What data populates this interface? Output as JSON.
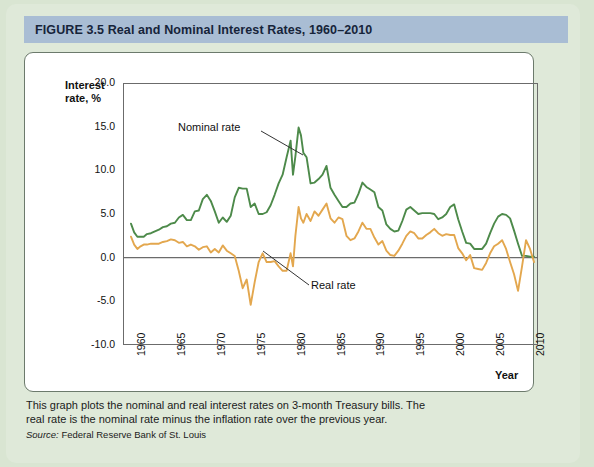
{
  "figure": {
    "label": "FIGURE",
    "number": "3.5",
    "title": "Real and Nominal Interest Rates, 1960–2010"
  },
  "colors": {
    "title_bar": "#a9bdd4",
    "page_background": "#dfe9d9",
    "nominal_line": "#4d8a4a",
    "real_line": "#e3a74e",
    "axis": "#6b6b6b"
  },
  "axis_title": "Interest rate, %",
  "x_axis_title": "Year",
  "annotations": [
    {
      "name": "nominal-rate-label",
      "text": "Nominal rate"
    },
    {
      "name": "real-rate-label",
      "text": "Real rate"
    }
  ],
  "caption": "This graph plots the nominal and real interest rates on 3-month Treasury bills. The real rate is the nominal rate minus the inflation rate over the previous year.",
  "source": {
    "word": "Source:",
    "text": " Federal Reserve Bank of St. Louis"
  },
  "chart_data": {
    "type": "line",
    "title": "Real and Nominal Interest Rates, 1960–2010",
    "xlabel": "Year",
    "ylabel": "Interest rate, %",
    "xlim": [
      1959.0,
      2011.0
    ],
    "ylim": [
      -10.0,
      20.0
    ],
    "yticks": [
      -10.0,
      -5.0,
      0.0,
      5.0,
      10.0,
      15.0,
      20.0
    ],
    "ytick_labels": [
      "-10.0",
      "-5.0",
      "0.0",
      "5.0",
      "10.0",
      "15.0",
      "20.0"
    ],
    "xticks": [
      1960,
      1965,
      1970,
      1975,
      1980,
      1985,
      1990,
      1995,
      2000,
      2005,
      2010
    ],
    "xtick_labels": [
      "1960",
      "1965",
      "1970",
      "1975",
      "1980",
      "1985",
      "1990",
      "1995",
      "2000",
      "2005",
      "2010"
    ],
    "grid": false,
    "legend": "annotated-inline",
    "zero_line": true,
    "series": [
      {
        "name": "Nominal rate",
        "color": "#4d8a4a",
        "x": [
          1960.0,
          1960.4,
          1960.8,
          1961.2,
          1961.6,
          1962.0,
          1962.5,
          1963.0,
          1963.5,
          1964.0,
          1964.5,
          1965.0,
          1965.5,
          1966.0,
          1966.5,
          1967.0,
          1967.5,
          1968.0,
          1968.5,
          1969.0,
          1969.5,
          1970.0,
          1970.5,
          1971.0,
          1971.5,
          1972.0,
          1972.5,
          1973.0,
          1973.5,
          1974.0,
          1974.5,
          1975.0,
          1975.5,
          1976.0,
          1976.5,
          1977.0,
          1977.5,
          1978.0,
          1978.5,
          1979.0,
          1979.5,
          1980.0,
          1980.3,
          1980.6,
          1981.0,
          1981.3,
          1981.6,
          1982.0,
          1982.5,
          1983.0,
          1983.5,
          1984.0,
          1984.5,
          1985.0,
          1985.5,
          1986.0,
          1986.5,
          1987.0,
          1987.5,
          1988.0,
          1988.5,
          1989.0,
          1989.5,
          1990.0,
          1990.5,
          1991.0,
          1991.5,
          1992.0,
          1992.5,
          1993.0,
          1993.5,
          1994.0,
          1994.5,
          1995.0,
          1995.5,
          1996.0,
          1996.5,
          1997.0,
          1997.5,
          1998.0,
          1998.5,
          1999.0,
          1999.5,
          2000.0,
          2000.5,
          2001.0,
          2001.5,
          2002.0,
          2002.5,
          2003.0,
          2003.5,
          2004.0,
          2004.5,
          2005.0,
          2005.5,
          2006.0,
          2006.5,
          2007.0,
          2007.5,
          2008.0,
          2008.5,
          2009.0,
          2009.5,
          2010.0,
          2010.5
        ],
        "y": [
          3.9,
          2.9,
          2.4,
          2.4,
          2.4,
          2.7,
          2.8,
          3.0,
          3.2,
          3.5,
          3.6,
          3.9,
          4.0,
          4.6,
          4.9,
          4.3,
          4.3,
          5.3,
          5.4,
          6.7,
          7.2,
          6.5,
          5.3,
          4.0,
          4.6,
          4.1,
          4.8,
          6.9,
          8.0,
          7.9,
          7.9,
          5.8,
          6.2,
          5.0,
          5.0,
          5.2,
          6.0,
          7.2,
          8.5,
          9.5,
          11.5,
          13.4,
          9.5,
          11.6,
          14.9,
          14.0,
          12.0,
          11.5,
          8.5,
          8.6,
          9.0,
          9.5,
          10.5,
          8.0,
          7.2,
          6.5,
          5.8,
          5.8,
          6.2,
          6.3,
          7.3,
          8.6,
          8.1,
          7.8,
          7.5,
          5.8,
          5.4,
          3.8,
          3.3,
          3.0,
          3.1,
          4.2,
          5.5,
          5.8,
          5.4,
          5.0,
          5.1,
          5.1,
          5.1,
          5.0,
          4.4,
          4.6,
          5.0,
          5.8,
          6.1,
          4.4,
          3.0,
          1.7,
          1.6,
          1.0,
          1.0,
          1.0,
          1.6,
          2.8,
          3.9,
          4.7,
          5.0,
          4.9,
          4.5,
          3.1,
          1.6,
          0.2,
          0.2,
          0.1,
          0.1
        ]
      },
      {
        "name": "Real rate",
        "color": "#e3a74e",
        "x": [
          1960.0,
          1960.4,
          1960.8,
          1961.2,
          1961.6,
          1962.0,
          1962.5,
          1963.0,
          1963.5,
          1964.0,
          1964.5,
          1965.0,
          1965.5,
          1966.0,
          1966.5,
          1967.0,
          1967.5,
          1968.0,
          1968.5,
          1969.0,
          1969.5,
          1970.0,
          1970.5,
          1971.0,
          1971.5,
          1972.0,
          1972.5,
          1973.0,
          1973.5,
          1974.0,
          1974.5,
          1975.0,
          1975.5,
          1976.0,
          1976.5,
          1977.0,
          1977.5,
          1978.0,
          1978.5,
          1979.0,
          1979.5,
          1980.0,
          1980.3,
          1980.6,
          1981.0,
          1981.3,
          1981.6,
          1982.0,
          1982.5,
          1983.0,
          1983.5,
          1984.0,
          1984.5,
          1985.0,
          1985.5,
          1986.0,
          1986.5,
          1987.0,
          1987.5,
          1988.0,
          1988.5,
          1989.0,
          1989.5,
          1990.0,
          1990.5,
          1991.0,
          1991.5,
          1992.0,
          1992.5,
          1993.0,
          1993.5,
          1994.0,
          1994.5,
          1995.0,
          1995.5,
          1996.0,
          1996.5,
          1997.0,
          1997.5,
          1998.0,
          1998.5,
          1999.0,
          1999.5,
          2000.0,
          2000.5,
          2001.0,
          2001.5,
          2002.0,
          2002.5,
          2003.0,
          2003.5,
          2004.0,
          2004.5,
          2005.0,
          2005.5,
          2006.0,
          2006.5,
          2007.0,
          2007.5,
          2008.0,
          2008.5,
          2009.0,
          2009.5,
          2010.0,
          2010.5
        ],
        "y": [
          2.4,
          1.5,
          1.0,
          1.3,
          1.5,
          1.5,
          1.6,
          1.6,
          1.6,
          1.8,
          1.9,
          2.1,
          2.0,
          1.7,
          1.8,
          1.3,
          1.5,
          1.3,
          0.9,
          1.2,
          1.3,
          0.6,
          1.0,
          0.6,
          1.4,
          0.8,
          0.5,
          0.2,
          -1.5,
          -3.5,
          -2.5,
          -5.4,
          -2.8,
          -0.5,
          0.5,
          -0.5,
          -0.5,
          -0.4,
          -1.0,
          -1.5,
          -1.5,
          0.5,
          -1.0,
          2.5,
          5.8,
          4.5,
          4.0,
          5.0,
          4.2,
          5.3,
          4.8,
          5.5,
          6.2,
          4.5,
          4.0,
          4.6,
          4.4,
          2.5,
          2.0,
          2.2,
          3.0,
          4.0,
          3.3,
          3.3,
          2.3,
          1.5,
          1.9,
          0.8,
          0.3,
          0.2,
          0.8,
          1.6,
          2.5,
          3.0,
          2.8,
          2.2,
          2.2,
          2.6,
          2.9,
          3.3,
          2.8,
          2.5,
          2.7,
          2.6,
          2.6,
          1.1,
          0.5,
          -0.3,
          0.3,
          -1.2,
          -1.3,
          -1.4,
          -0.6,
          0.5,
          1.3,
          1.6,
          2.0,
          1.0,
          -0.5,
          -1.9,
          -3.8,
          -1.0,
          2.0,
          1.0,
          -0.5
        ]
      }
    ]
  }
}
